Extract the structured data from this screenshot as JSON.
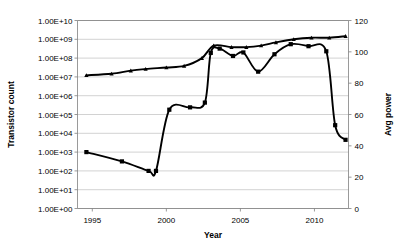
{
  "chart_data": {
    "type": "line",
    "title": "",
    "xlabel": "Year",
    "ylabel": "Transistor count",
    "y2label": "Avg power",
    "xlim": [
      1994,
      2012.3
    ],
    "ylim": [
      1,
      10000000000
    ],
    "y2lim": [
      0,
      120
    ],
    "yscale": "log",
    "grid": true,
    "legend": "none",
    "x_ticks": [
      "1995",
      "2000",
      "2005",
      "2010"
    ],
    "x_tick_values": [
      1995,
      2000,
      2005,
      2010
    ],
    "y_ticks": [
      "1.00E+00",
      "1.00E+01",
      "1.00E+02",
      "1.00E+03",
      "1.00E+04",
      "1.00E+05",
      "1.00E+06",
      "1.00E+07",
      "1.00E+08",
      "1.00E+09",
      "1.00E+10"
    ],
    "y_tick_values": [
      1,
      10,
      100,
      1000,
      10000,
      100000,
      1000000,
      10000000,
      100000000,
      1000000000,
      10000000000
    ],
    "y2_ticks": [
      "0",
      "20",
      "40",
      "60",
      "80",
      "100",
      "120"
    ],
    "y2_tick_values": [
      0,
      20,
      40,
      60,
      80,
      100,
      120
    ],
    "series": [
      {
        "name": "Transistor count",
        "axis": "left",
        "marker": "square",
        "x": [
          1994.6,
          1997.0,
          1998.8,
          1999.3,
          2000.2,
          2001.6,
          2002.6,
          2003.0,
          2003.6,
          2004.5,
          2005.2,
          2006.2,
          2007.3,
          2008.4,
          2009.6,
          2010.8,
          2011.4,
          2012.1
        ],
        "values": [
          1000,
          320,
          100,
          100,
          180000,
          240000,
          430000,
          190000000,
          320000000,
          130000000,
          200000000,
          19000000,
          160000000,
          550000000,
          430000000,
          230000000,
          27000,
          4500
        ]
      },
      {
        "name": "Avg power",
        "axis": "right",
        "marker": "triangle",
        "x": [
          1994.6,
          1996.3,
          1997.6,
          1998.6,
          2000.0,
          2001.2,
          2002.4,
          2003.2,
          2004.4,
          2005.4,
          2006.4,
          2007.4,
          2008.6,
          2009.8,
          2011.0,
          2012.1
        ],
        "values": [
          85,
          86,
          88,
          89,
          90,
          91,
          96,
          104,
          103,
          103,
          104,
          106,
          108,
          109,
          109,
          110
        ]
      }
    ]
  }
}
